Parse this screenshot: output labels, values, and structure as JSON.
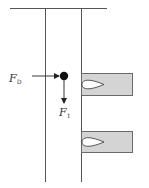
{
  "diagram": {
    "type": "force-diagram",
    "labels": {
      "drag_force": {
        "main": "F",
        "sub": "D"
      },
      "lift_force": {
        "main": "F",
        "sub": "1"
      }
    },
    "colors": {
      "line": "#555555",
      "block_fill": "#d4d4d4",
      "block_stroke": "#6a6a6a",
      "particle": "#111111",
      "cavity": "#ffffff"
    },
    "elements": {
      "top_wall": true,
      "channel_walls": 2,
      "particle": 1,
      "side_blocks": 2
    }
  }
}
